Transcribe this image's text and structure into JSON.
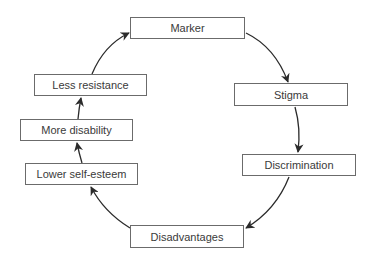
{
  "diagram": {
    "type": "cycle",
    "direction": "clockwise",
    "colors": {
      "box_border": "#6b6b6b",
      "text": "#3a3a3a",
      "arrow": "#2b2b2b",
      "background": "#ffffff"
    },
    "nodes": [
      {
        "id": "marker",
        "label": "Marker",
        "x": 130,
        "y": 17,
        "w": 115,
        "h": 22
      },
      {
        "id": "stigma",
        "label": "Stigma",
        "x": 234,
        "y": 83,
        "w": 114,
        "h": 23
      },
      {
        "id": "discrimination",
        "label": "Discrimination",
        "x": 242,
        "y": 154,
        "w": 114,
        "h": 22
      },
      {
        "id": "disadvantages",
        "label": "Disadvantages",
        "x": 130,
        "y": 225,
        "w": 114,
        "h": 23
      },
      {
        "id": "lower-self-esteem",
        "label": "Lower self-esteem",
        "x": 25,
        "y": 163,
        "w": 113,
        "h": 22
      },
      {
        "id": "more-disability",
        "label": "More disability",
        "x": 20,
        "y": 119,
        "w": 113,
        "h": 22
      },
      {
        "id": "less-resistance",
        "label": "Less resistance",
        "x": 34,
        "y": 74,
        "w": 113,
        "h": 22
      }
    ],
    "edges": [
      {
        "from": "marker",
        "to": "stigma"
      },
      {
        "from": "stigma",
        "to": "discrimination"
      },
      {
        "from": "discrimination",
        "to": "disadvantages"
      },
      {
        "from": "disadvantages",
        "to": "lower-self-esteem"
      },
      {
        "from": "lower-self-esteem",
        "to": "more-disability"
      },
      {
        "from": "more-disability",
        "to": "less-resistance"
      },
      {
        "from": "less-resistance",
        "to": "marker"
      }
    ]
  }
}
